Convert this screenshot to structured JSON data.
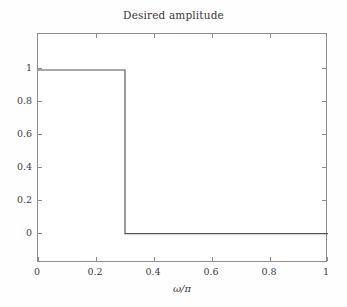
{
  "chart_data": {
    "type": "line",
    "title": "Desired amplitude",
    "xlabel": "ω/π",
    "ylabel": "",
    "grid": false,
    "legend": null,
    "xlim": [
      0,
      1
    ],
    "ylim": [
      -0.18,
      1.22
    ],
    "xticks": [
      "0",
      "0.2",
      "0.4",
      "0.6",
      "0.8",
      "1"
    ],
    "xtick_values": [
      0,
      0.2,
      0.4,
      0.6,
      0.8,
      1
    ],
    "yticks": [
      "0",
      "0.2",
      "0.4",
      "0.6",
      "0.8",
      "1"
    ],
    "ytick_values": [
      0,
      0.2,
      0.4,
      0.6,
      0.8,
      1
    ],
    "series": [
      {
        "name": "Desired amplitude",
        "color": "#555555",
        "x": [
          0,
          0.3,
          0.3,
          1
        ],
        "values": [
          1,
          1,
          0,
          0
        ]
      }
    ],
    "passband_edge": 0.3,
    "passband_amplitude": 1,
    "stopband_amplitude": 0
  },
  "axes": {
    "frame_color": "#8e8e8e",
    "tick_color": "#8a8a8a",
    "background": "#ffffff"
  }
}
